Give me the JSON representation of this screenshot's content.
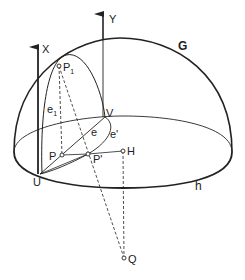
{
  "figure": {
    "type": "geometric-diagram",
    "colors": {
      "ink": "#222222",
      "background": "#ffffff"
    },
    "labels": {
      "axis_x": "X",
      "axis_y": "Y",
      "great_circle": "G",
      "horizon": "h",
      "point_p1": "P",
      "point_p1_sub": "1",
      "curve_e1": "e",
      "curve_e1_sub": "1",
      "point_v": "V",
      "curve_e": "e",
      "curve_e_prime": "e'",
      "point_p": "P",
      "point_p_prime": "P'",
      "point_h": "H",
      "point_u": "U",
      "point_q": "Q"
    }
  }
}
